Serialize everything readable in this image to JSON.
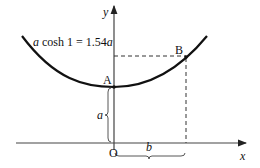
{
  "diagram": {
    "equation_label": "a cosh 1 = 1.54a",
    "equation_parts": {
      "a1": "a",
      "mid": " cosh 1 = 1.54",
      "a2": "a"
    },
    "axis_x_label": "x",
    "axis_y_label": "y",
    "origin_label": "O",
    "point_a_label": "A",
    "point_b_label": "B",
    "height_label": "a",
    "width_label": "b",
    "colors": {
      "curve": "#111111",
      "axis": "#333333",
      "dashed": "#333333"
    }
  }
}
